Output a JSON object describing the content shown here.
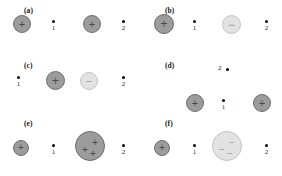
{
  "figure": {
    "caption": "",
    "width": 282,
    "height": 176,
    "colors": {
      "positive_charge_fill": "#9c9c9c",
      "positive_charge_stroke": "#6d6d6d",
      "negative_charge_fill": "#e2e2e2",
      "negative_charge_stroke": "#c2c2c2",
      "field_point": "#000000",
      "text": "#1a1a1a",
      "background": "#ffffff"
    },
    "glyphs": {
      "positive": "+",
      "negative": "−"
    }
  },
  "panels": [
    {
      "id": "a",
      "label": "(a)",
      "label_x": 24,
      "label_y": 6,
      "charges": [
        {
          "name": "charge-positive-left",
          "sign": "+",
          "polarity": "pos",
          "x": 13,
          "y": 15,
          "size": 18,
          "count": 1
        },
        {
          "name": "charge-positive-right",
          "sign": "+",
          "polarity": "pos",
          "x": 83,
          "y": 15,
          "size": 18,
          "count": 1
        }
      ],
      "points": [
        {
          "name": "field-point-1",
          "label": "1",
          "x": 52,
          "y": 20
        },
        {
          "name": "field-point-2",
          "label": "2",
          "x": 122,
          "y": 20
        }
      ]
    },
    {
      "id": "b",
      "label": "(b)",
      "label_x": 165,
      "label_y": 6,
      "charges": [
        {
          "name": "charge-positive-left",
          "sign": "+",
          "polarity": "pos",
          "x": 154,
          "y": 14,
          "size": 20,
          "count": 1
        },
        {
          "name": "charge-negative-right",
          "sign": "−",
          "polarity": "neg",
          "x": 222,
          "y": 15,
          "size": 19,
          "count": 1
        }
      ],
      "points": [
        {
          "name": "field-point-1",
          "label": "1",
          "x": 193,
          "y": 20
        },
        {
          "name": "field-point-2",
          "label": "2",
          "x": 265,
          "y": 20
        }
      ]
    },
    {
      "id": "c",
      "label": "(c)",
      "label_x": 24,
      "label_y": 61,
      "charges": [
        {
          "name": "charge-positive-middle-left",
          "sign": "+",
          "polarity": "pos",
          "x": 46,
          "y": 71,
          "size": 19,
          "count": 1
        },
        {
          "name": "charge-negative-middle-right",
          "sign": "−",
          "polarity": "neg",
          "x": 80,
          "y": 72,
          "size": 18,
          "count": 1
        }
      ],
      "points": [
        {
          "name": "field-point-1",
          "label": "1",
          "x": 17,
          "y": 76
        },
        {
          "name": "field-point-2",
          "label": "2",
          "x": 122,
          "y": 76
        }
      ]
    },
    {
      "id": "d",
      "label": "(d)",
      "label_x": 165,
      "label_y": 61,
      "charges": [
        {
          "name": "charge-positive-left",
          "sign": "+",
          "polarity": "pos",
          "x": 186,
          "y": 94,
          "size": 18,
          "count": 1
        },
        {
          "name": "charge-positive-right",
          "sign": "+",
          "polarity": "pos",
          "x": 253,
          "y": 94,
          "size": 18,
          "count": 1
        }
      ],
      "points": [
        {
          "name": "field-point-1",
          "label": "1",
          "x": 222,
          "y": 99,
          "label_pos": "below"
        },
        {
          "name": "field-point-2",
          "label": "2",
          "x": 226,
          "y": 68,
          "label_pos": "left"
        }
      ]
    },
    {
      "id": "e",
      "label": "(e)",
      "label_x": 24,
      "label_y": 119,
      "charges": [
        {
          "name": "charge-positive-small",
          "sign": "+",
          "polarity": "pos",
          "x": 13,
          "y": 140,
          "size": 16,
          "count": 1
        },
        {
          "name": "charge-positive-large",
          "sign": "+",
          "polarity": "pos",
          "x": 75,
          "y": 131,
          "size": 30,
          "count": 3
        }
      ],
      "points": [
        {
          "name": "field-point-1",
          "label": "1",
          "x": 52,
          "y": 144
        },
        {
          "name": "field-point-2",
          "label": "2",
          "x": 122,
          "y": 144
        }
      ]
    },
    {
      "id": "f",
      "label": "(f)",
      "label_x": 165,
      "label_y": 119,
      "charges": [
        {
          "name": "charge-positive-small",
          "sign": "+",
          "polarity": "pos",
          "x": 154,
          "y": 140,
          "size": 16,
          "count": 1
        },
        {
          "name": "charge-negative-large",
          "sign": "−",
          "polarity": "neg",
          "x": 212,
          "y": 131,
          "size": 30,
          "count": 3
        }
      ],
      "points": [
        {
          "name": "field-point-1",
          "label": "1",
          "x": 193,
          "y": 144
        },
        {
          "name": "field-point-2",
          "label": "2",
          "x": 265,
          "y": 144
        }
      ]
    }
  ]
}
